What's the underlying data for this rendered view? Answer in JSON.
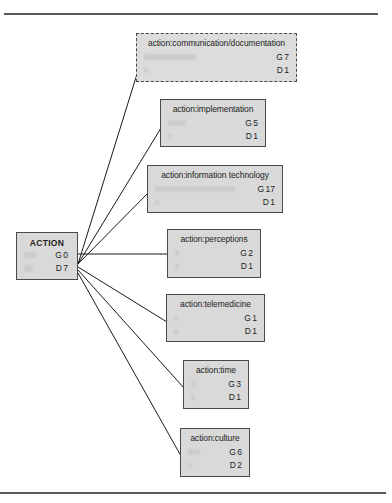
{
  "page": {
    "background_color": "#ffffff",
    "frame_color": "#5a5a5a",
    "node_fill_color": "#d9d9d9",
    "node_border_color": "#4a4a4a",
    "edge_color": "#1a1a1a"
  },
  "diagram": {
    "type": "tree",
    "root_label": "ACTION",
    "nodes": [
      {
        "id": "root",
        "label": "ACTION",
        "g_key": "G",
        "g_value": "0",
        "d_key": "D",
        "d_value": "7",
        "border_style": "solid"
      },
      {
        "id": "communication-documentation",
        "label": "action:communication/documentation",
        "g_key": "G",
        "g_value": "7",
        "d_key": "D",
        "d_value": "1",
        "border_style": "dashed"
      },
      {
        "id": "implementation",
        "label": "action:implementation",
        "g_key": "G",
        "g_value": "5",
        "d_key": "D",
        "d_value": "1",
        "border_style": "solid"
      },
      {
        "id": "information-technology",
        "label": "action:information technology",
        "g_key": "G",
        "g_value": "17",
        "d_key": "D",
        "d_value": "1",
        "border_style": "solid"
      },
      {
        "id": "perceptions",
        "label": "action:perceptions",
        "g_key": "G",
        "g_value": "2",
        "d_key": "D",
        "d_value": "1",
        "border_style": "solid"
      },
      {
        "id": "telemedicine",
        "label": "action:telemedicine",
        "g_key": "G",
        "g_value": "1",
        "d_key": "D",
        "d_value": "1",
        "border_style": "solid"
      },
      {
        "id": "time",
        "label": "action:time",
        "g_key": "G",
        "g_value": "3",
        "d_key": "D",
        "d_value": "1",
        "border_style": "solid"
      },
      {
        "id": "culture",
        "label": "action:culture",
        "g_key": "G",
        "g_value": "6",
        "d_key": "D",
        "d_value": "2",
        "border_style": "solid"
      }
    ]
  }
}
